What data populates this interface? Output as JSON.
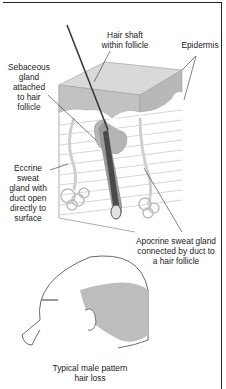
{
  "diagram": {
    "labels": {
      "hair_shaft": [
        "Hair shaft",
        "within follicle"
      ],
      "epidermis": [
        "Epidermis"
      ],
      "sebaceous": [
        "Sebaceous",
        "gland",
        "attached",
        "to hair",
        "follicle"
      ],
      "eccrine": [
        "Eccrine",
        "sweat",
        "gland with",
        "duct open",
        "directly to",
        "surface"
      ],
      "apocrine": [
        "Apocrine sweat gland",
        "connected by duct to",
        "a hair follicle"
      ],
      "head_caption": [
        "Typical male pattern",
        "hair loss"
      ]
    },
    "colors": {
      "skin_layer": "#c8c8c8",
      "dermis_lines": "#bdbdbd",
      "hair": "#3a3a3a",
      "hair_loss_shade": "#bdbdbd",
      "line": "#333333"
    }
  }
}
